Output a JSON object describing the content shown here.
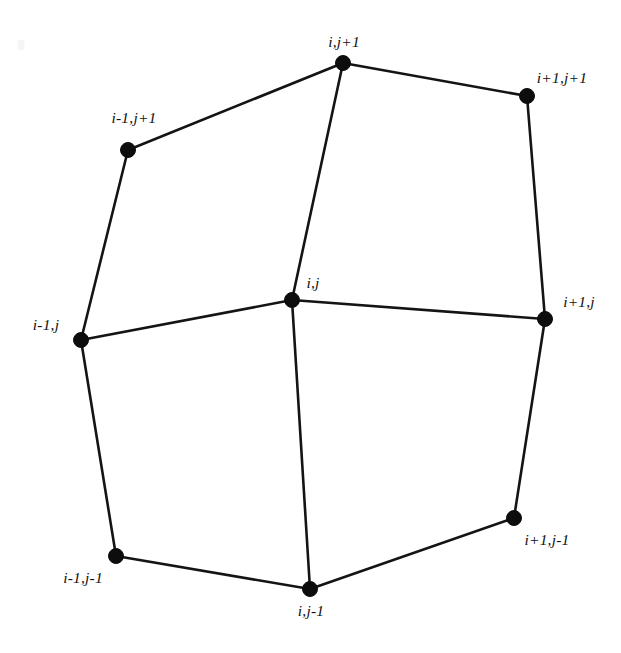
{
  "figure": {
    "kind": "finite-difference-stencil",
    "background_color": "#ffffff",
    "line_color": "#141414",
    "node_color": "#0d0d0d",
    "width": 621,
    "height": 653
  },
  "chart_data": {
    "type": "diagram",
    "title": "",
    "xlabel": "",
    "ylabel": "",
    "nodes": [
      {
        "id": "i-1,j+1",
        "label": "i-1,j+1",
        "x": 128,
        "y": 150,
        "label_x": 134,
        "label_y": 118
      },
      {
        "id": "i,j+1",
        "label": "i,j+1",
        "x": 343,
        "y": 63,
        "label_x": 344,
        "label_y": 42
      },
      {
        "id": "i+1,j+1",
        "label": "i+1,j+1",
        "x": 527,
        "y": 96,
        "label_x": 562,
        "label_y": 78
      },
      {
        "id": "i-1,j",
        "label": "i-1,j",
        "x": 81,
        "y": 340,
        "label_x": 46,
        "label_y": 325
      },
      {
        "id": "i,j",
        "label": "i,j",
        "x": 292,
        "y": 300,
        "label_x": 313,
        "label_y": 283
      },
      {
        "id": "i+1,j",
        "label": "i+1,j",
        "x": 545,
        "y": 319,
        "label_x": 579,
        "label_y": 302
      },
      {
        "id": "i-1,j-1",
        "label": "i-1,j-1",
        "x": 116,
        "y": 556,
        "label_x": 83,
        "label_y": 578
      },
      {
        "id": "i,j-1",
        "label": "i,j-1",
        "x": 310,
        "y": 589,
        "label_x": 311,
        "label_y": 611
      },
      {
        "id": "i+1,j-1",
        "label": "i+1,j-1",
        "x": 514,
        "y": 518,
        "label_x": 547,
        "label_y": 540
      }
    ],
    "edges": [
      {
        "from": "i-1,j+1",
        "to": "i,j+1"
      },
      {
        "from": "i,j+1",
        "to": "i+1,j+1"
      },
      {
        "from": "i-1,j+1",
        "to": "i-1,j"
      },
      {
        "from": "i+1,j+1",
        "to": "i+1,j"
      },
      {
        "from": "i-1,j",
        "to": "i,j"
      },
      {
        "from": "i,j",
        "to": "i+1,j"
      },
      {
        "from": "i,j+1",
        "to": "i,j"
      },
      {
        "from": "i,j",
        "to": "i,j-1"
      },
      {
        "from": "i-1,j",
        "to": "i-1,j-1"
      },
      {
        "from": "i+1,j",
        "to": "i+1,j-1"
      },
      {
        "from": "i-1,j-1",
        "to": "i,j-1"
      },
      {
        "from": "i,j-1",
        "to": "i+1,j-1"
      }
    ],
    "node_radius": 7.5,
    "legend": [],
    "annotations": []
  },
  "artifacts": [
    {
      "name": "scan-speck",
      "x": 21,
      "y": 45
    }
  ]
}
